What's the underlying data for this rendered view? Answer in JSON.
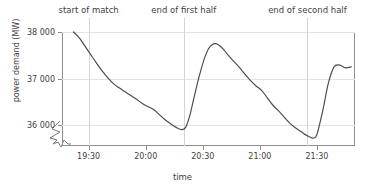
{
  "chart_data": {
    "type": "line",
    "title": "",
    "xlabel": "time",
    "ylabel": "power demand (MW)",
    "ylim": [
      35550,
      38000
    ],
    "xlim": [
      "19:16",
      "21:50"
    ],
    "grid": true,
    "legend": "none",
    "y_ticks": [
      {
        "value": 36000,
        "label": "36 000"
      },
      {
        "value": 37000,
        "label": "37 000"
      },
      {
        "value": 38000,
        "label": "38 000"
      }
    ],
    "x_ticks": [
      {
        "value": "19:30",
        "label": "19:30"
      },
      {
        "value": "20:00",
        "label": "20:00"
      },
      {
        "value": "20:30",
        "label": "20:30"
      },
      {
        "value": "21:00",
        "label": "21:00"
      },
      {
        "value": "21:30",
        "label": "21:30"
      }
    ],
    "annotations": [
      {
        "label": "start of match",
        "x": "19:30"
      },
      {
        "label": "end of first half",
        "x": "20:20"
      },
      {
        "label": "end of second half",
        "x": "21:25"
      }
    ],
    "axis_break": true,
    "series": [
      {
        "name": "power demand",
        "color": "#4d4d4d",
        "x": [
          "19:22",
          "19:25",
          "19:28",
          "19:31",
          "19:34",
          "19:37",
          "19:40",
          "19:43",
          "19:46",
          "19:49",
          "19:52",
          "19:55",
          "19:58",
          "20:01",
          "20:04",
          "20:07",
          "20:10",
          "20:13",
          "20:16",
          "20:19",
          "20:21",
          "20:23",
          "20:25",
          "20:27",
          "20:29",
          "20:31",
          "20:33",
          "20:35",
          "20:37",
          "20:39",
          "20:41",
          "20:43",
          "20:46",
          "20:49",
          "20:52",
          "20:55",
          "20:58",
          "21:01",
          "21:04",
          "21:07",
          "21:10",
          "21:13",
          "21:16",
          "21:19",
          "21:22",
          "21:24",
          "21:26",
          "21:28",
          "21:30",
          "21:33",
          "21:36",
          "21:39",
          "21:42",
          "21:45",
          "21:48"
        ],
        "y": [
          38000,
          37880,
          37700,
          37520,
          37340,
          37170,
          37020,
          36890,
          36800,
          36720,
          36640,
          36560,
          36470,
          36400,
          36340,
          36230,
          36120,
          36030,
          35950,
          35900,
          35950,
          36180,
          36520,
          36870,
          37180,
          37450,
          37640,
          37730,
          37750,
          37700,
          37620,
          37520,
          37380,
          37250,
          37100,
          36960,
          36840,
          36740,
          36580,
          36420,
          36300,
          36160,
          36030,
          35930,
          35850,
          35790,
          35750,
          35720,
          35800,
          36300,
          36900,
          37250,
          37290,
          37230,
          37250
        ]
      }
    ]
  },
  "axes": {
    "ylabel": "power demand (MW)",
    "xlabel": "time"
  }
}
